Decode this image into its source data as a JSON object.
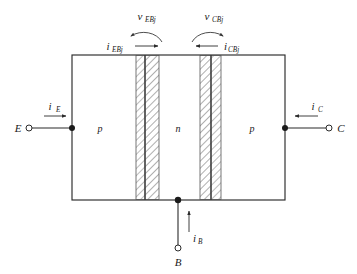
{
  "figure": {
    "kind": "pnp-bipolar-junction-transistor-cross-section",
    "background_color": "#ffffff",
    "line_color": "#2b2b2b"
  },
  "device": {
    "regions": [
      {
        "id": "emitter",
        "label": "p",
        "x_center": 100,
        "doping": "p"
      },
      {
        "id": "base",
        "label": "n",
        "x_center": 178,
        "doping": "n"
      },
      {
        "id": "collector",
        "label": "p",
        "x_center": 252,
        "doping": "p"
      }
    ],
    "body_rect": {
      "x": 72,
      "y": 55,
      "width": 213,
      "height": 145
    },
    "junctions": [
      {
        "id": "emitter-base-junction",
        "name": "EBj",
        "line_x": 145,
        "depletion_left": {
          "x": 136,
          "width": 9
        },
        "depletion_right": {
          "x": 145,
          "width": 14
        }
      },
      {
        "id": "collector-base-junction",
        "name": "CBj",
        "line_x": 211,
        "depletion_left": {
          "x": 200,
          "width": 11
        },
        "depletion_right": {
          "x": 211,
          "width": 10
        }
      }
    ]
  },
  "terminals": [
    {
      "id": "emitter-terminal",
      "label": "E",
      "x": 22,
      "y": 128,
      "side": "left"
    },
    {
      "id": "collector-terminal",
      "label": "C",
      "x": 337,
      "y": 128,
      "side": "right"
    },
    {
      "id": "base-terminal",
      "label": "B",
      "x": 178,
      "y": 258,
      "side": "bottom"
    }
  ],
  "currents": [
    {
      "id": "emitter-current",
      "symbol": "i",
      "subscript": "E",
      "direction": "right",
      "label_x": 58,
      "label_y": 108
    },
    {
      "id": "collector-current",
      "symbol": "i",
      "subscript": "C",
      "direction": "left",
      "label_x": 312,
      "label_y": 108
    },
    {
      "id": "base-current",
      "symbol": "i",
      "subscript": "B",
      "direction": "up",
      "label_x": 192,
      "label_y": 238
    },
    {
      "id": "emitter-base-junction-current",
      "symbol": "i",
      "subscript": "EBj",
      "direction": "right",
      "label_x": 112,
      "label_y": 48
    },
    {
      "id": "collector-base-junction-current",
      "symbol": "i",
      "subscript": "CBj",
      "direction": "left",
      "label_x": 228,
      "label_y": 48
    }
  ],
  "voltages": [
    {
      "id": "emitter-base-junction-voltage",
      "symbol": "v",
      "subscript": "EBj",
      "arc_direction": "counterclockwise",
      "arrow_end": "left",
      "label_x": 150,
      "label_y": 18
    },
    {
      "id": "collector-base-junction-voltage",
      "symbol": "v",
      "subscript": "CBj",
      "arc_direction": "clockwise",
      "arrow_end": "right",
      "label_x": 216,
      "label_y": 18
    }
  ]
}
